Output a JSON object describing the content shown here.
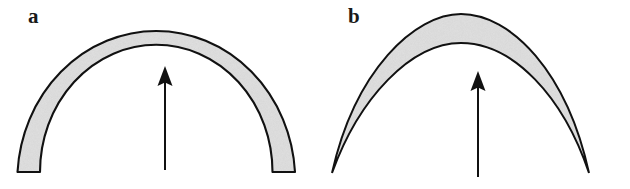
{
  "figure": {
    "type": "line-drawing",
    "background_color": "#ffffff",
    "width": 630,
    "height": 189
  },
  "style": {
    "outline_color": "#111111",
    "fill_color": "#c9c9c9",
    "fill_texture": "stipple",
    "arrow_color": "#111111",
    "label_color": "#1a1a1a"
  },
  "panels": [
    {
      "id": "a",
      "label": "a",
      "shape": "semicircular-arch",
      "arrow": "up-arrow",
      "arrow_icon": "arrow-up-icon"
    },
    {
      "id": "b",
      "label": "b",
      "shape": "pointed-lenticular-arch",
      "arrow": "up-arrow",
      "arrow_icon": "arrow-up-icon"
    }
  ]
}
